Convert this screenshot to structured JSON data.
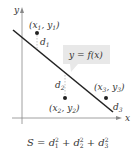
{
  "diagram": {
    "axes": {
      "x_label": "x",
      "y_label": "y"
    },
    "curve_label": "y = f(x)",
    "points": [
      {
        "name": "x1,y1",
        "x": "x",
        "x_sub": "1",
        "y": "y",
        "y_sub": "1",
        "distance": "d",
        "distance_sub": "1"
      },
      {
        "name": "x2,y2",
        "x": "x",
        "x_sub": "2",
        "y": "y",
        "y_sub": "2",
        "distance": "d",
        "distance_sub": "2"
      },
      {
        "name": "x3,y3",
        "x": "x",
        "x_sub": "3",
        "y": "y",
        "y_sub": "3",
        "distance": "d",
        "distance_sub": "3"
      }
    ],
    "equation": {
      "lhs": "S",
      "equals": "=",
      "terms": [
        {
          "base": "d",
          "sub": "1",
          "sup": "2"
        },
        {
          "base": "d",
          "sub": "2",
          "sup": "2"
        },
        {
          "base": "d",
          "sub": "3",
          "sup": "2"
        }
      ],
      "plus": "+"
    },
    "colors": {
      "ink": "#222222",
      "axis": "#888888",
      "callout_bg": "#e8e8e8",
      "dashed": "#aaaaaa",
      "text": "#333333"
    }
  }
}
